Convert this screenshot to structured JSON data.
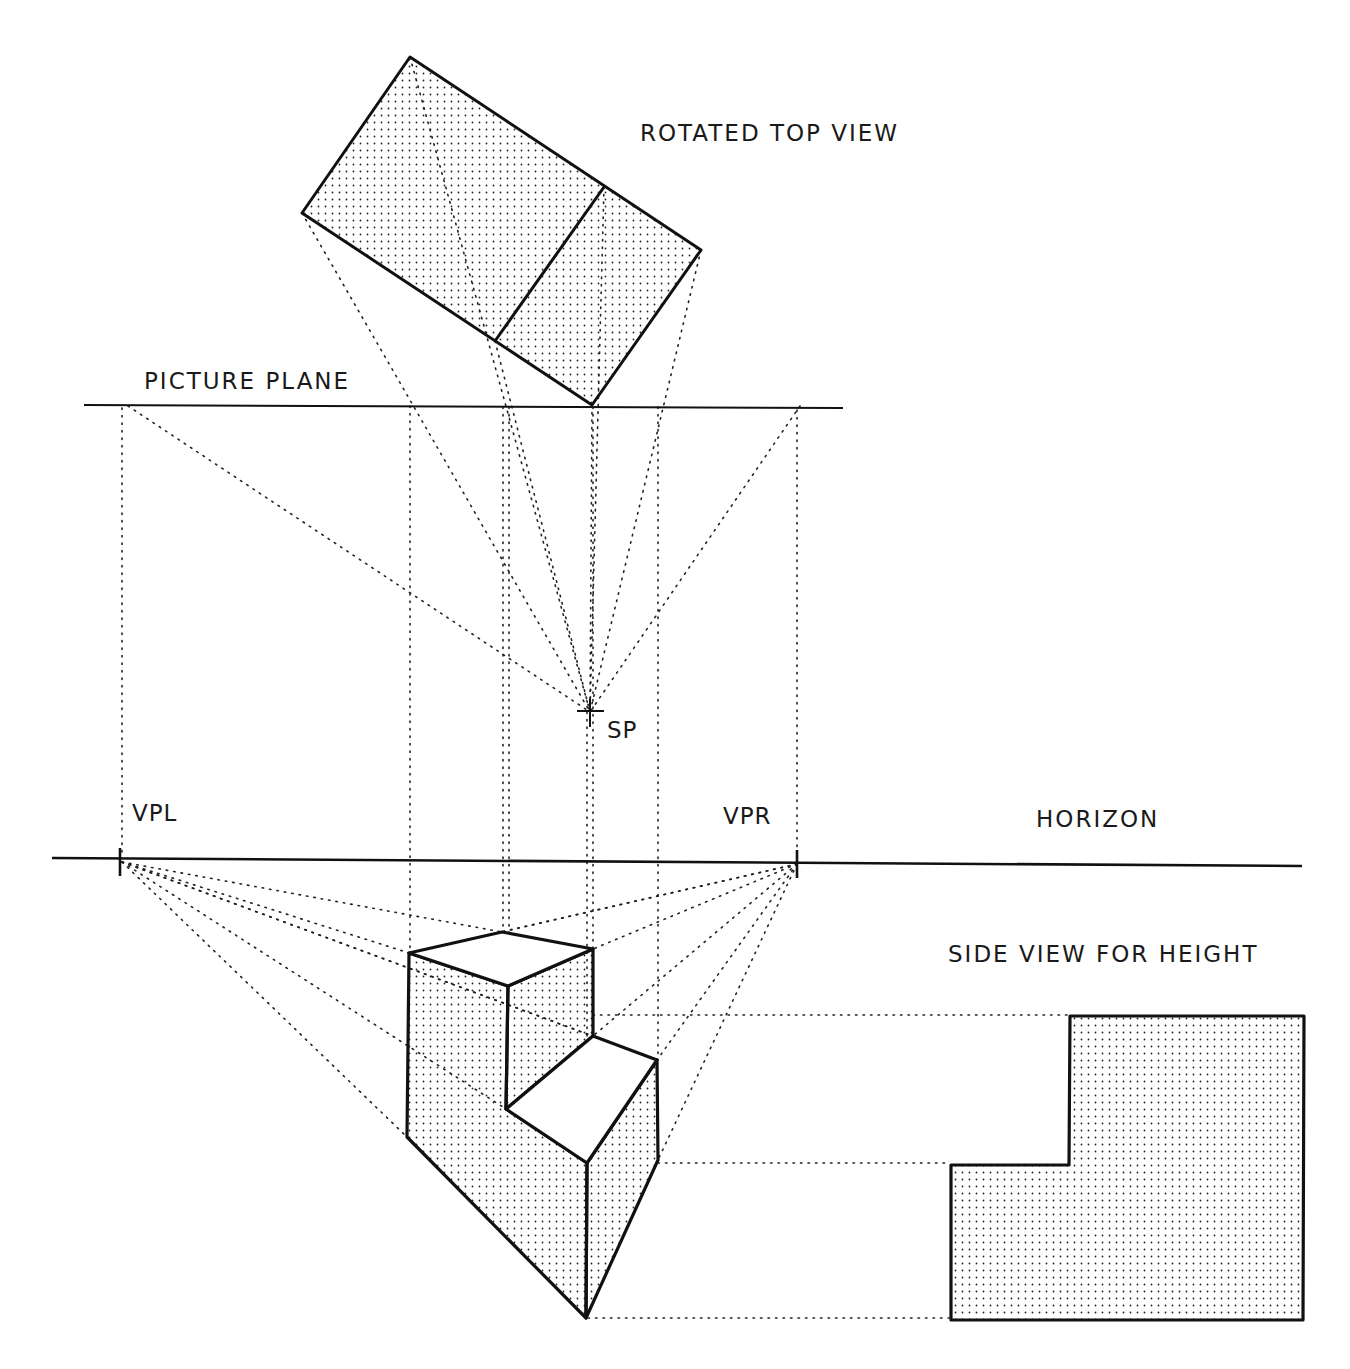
{
  "labels": {
    "rotated_top_view": "ROTATED TOP VIEW",
    "picture_plane": "PICTURE PLANE",
    "station_point": "SP",
    "vanishing_point_left": "VPL",
    "vanishing_point_right": "VPR",
    "horizon": "HORIZON",
    "side_view": "SIDE VIEW FOR HEIGHT"
  },
  "colors": {
    "line": "#111111",
    "stipple": "#222222",
    "background": "#ffffff"
  }
}
